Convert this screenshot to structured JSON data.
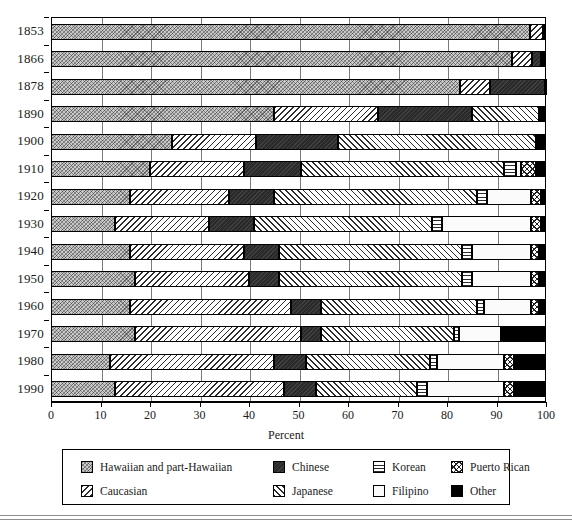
{
  "chart_data": {
    "type": "bar",
    "orientation": "horizontal",
    "stacked": true,
    "title": "",
    "xlabel": "Percent",
    "ylabel": "",
    "xlim": [
      0,
      100
    ],
    "xticks": [
      0,
      10,
      20,
      30,
      40,
      50,
      60,
      70,
      80,
      90,
      100
    ],
    "grid": true,
    "legend_position": "bottom",
    "categories": [
      "1853",
      "1866",
      "1878",
      "1890",
      "1900",
      "1910",
      "1920",
      "1930",
      "1940",
      "1950",
      "1960",
      "1970",
      "1980",
      "1990"
    ],
    "series": [
      {
        "name": "Hawaiian and part-Hawaiian",
        "pattern": "pat-hawaiian",
        "values": [
          96.8,
          93.2,
          82.6,
          45.0,
          24.5,
          20.0,
          16.0,
          13.0,
          16.0,
          17.0,
          16.0,
          17.0,
          12.0,
          13.0
        ]
      },
      {
        "name": "Caucasian",
        "pattern": "pat-caucasian",
        "values": [
          2.6,
          4.0,
          6.1,
          21.0,
          17.0,
          19.0,
          20.0,
          19.0,
          23.0,
          23.0,
          32.5,
          33.5,
          33.0,
          34.0
        ]
      },
      {
        "name": "Chinese",
        "pattern": "pat-chinese",
        "values": [
          0.0,
          1.8,
          11.0,
          19.0,
          16.5,
          11.5,
          9.0,
          9.0,
          7.0,
          6.0,
          6.0,
          4.0,
          6.5,
          6.5
        ]
      },
      {
        "name": "Japanese",
        "pattern": "pat-japanese",
        "values": [
          0.0,
          0.0,
          0.0,
          13.5,
          40.0,
          41.0,
          41.0,
          36.0,
          37.0,
          37.0,
          31.5,
          27.0,
          25.0,
          20.5
        ]
      },
      {
        "name": "Korean",
        "pattern": "pat-korean",
        "values": [
          0.0,
          0.0,
          0.0,
          0.0,
          0.0,
          2.5,
          2.0,
          2.0,
          2.0,
          2.0,
          1.5,
          1.0,
          1.5,
          2.0
        ]
      },
      {
        "name": "Filipino",
        "pattern": "pat-filipino",
        "values": [
          0.0,
          0.0,
          0.0,
          0.0,
          0.0,
          1.0,
          9.0,
          18.0,
          12.0,
          12.0,
          9.5,
          8.5,
          13.5,
          15.5
        ]
      },
      {
        "name": "Puerto Rican",
        "pattern": "pat-puertorican",
        "values": [
          0.0,
          0.0,
          0.0,
          0.0,
          0.0,
          3.0,
          2.0,
          2.0,
          1.5,
          1.5,
          1.5,
          0.0,
          2.0,
          2.0
        ]
      },
      {
        "name": "Other",
        "pattern": "pat-other",
        "values": [
          0.6,
          1.0,
          0.3,
          1.5,
          2.0,
          2.0,
          1.0,
          1.0,
          1.5,
          1.5,
          1.5,
          9.0,
          6.5,
          6.5
        ]
      }
    ]
  },
  "axis": {
    "x_title": "Percent",
    "x_tick_labels": [
      "0",
      "10",
      "20",
      "30",
      "40",
      "50",
      "60",
      "70",
      "80",
      "90",
      "100"
    ],
    "y_tick_labels": [
      "1853",
      "1866",
      "1878",
      "1890",
      "1900",
      "1910",
      "1920",
      "1930",
      "1940",
      "1950",
      "1960",
      "1970",
      "1980",
      "1990"
    ]
  },
  "legend": {
    "entries": [
      {
        "label": "Hawaiian and part-Hawaiian",
        "pattern": "pat-hawaiian"
      },
      {
        "label": "Caucasian",
        "pattern": "pat-caucasian"
      },
      {
        "label": "Chinese",
        "pattern": "pat-chinese"
      },
      {
        "label": "Japanese",
        "pattern": "pat-japanese"
      },
      {
        "label": "Korean",
        "pattern": "pat-korean"
      },
      {
        "label": "Filipino",
        "pattern": "pat-filipino"
      },
      {
        "label": "Puerto Rican",
        "pattern": "pat-puertorican"
      },
      {
        "label": "Other",
        "pattern": "pat-other"
      }
    ]
  },
  "colors": {
    "axis": "#000000",
    "grid": "#7a7a7a",
    "background": "#ffffff",
    "text": "#1a1a1a"
  }
}
